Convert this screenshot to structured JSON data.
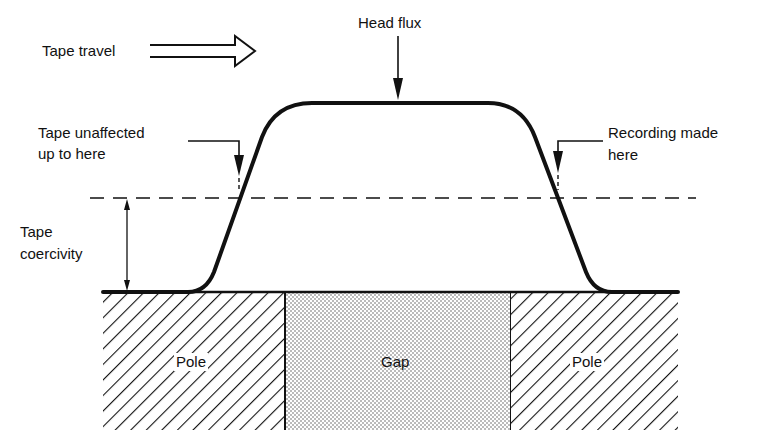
{
  "diagram": {
    "type": "magnetic-recording-head-field",
    "labels": {
      "tape_travel": "Tape travel",
      "head_flux": "Head flux",
      "tape_unaffected_line1": "Tape unaffected",
      "tape_unaffected_line2": "up to here",
      "recording_made_line1": "Recording made",
      "recording_made_line2": "here",
      "tape_coercivity_line1": "Tape",
      "tape_coercivity_line2": "coercivity",
      "pole_left": "Pole",
      "gap": "Gap",
      "pole_right": "Pole"
    },
    "colors": {
      "ink": "#111111",
      "background": "#ffffff",
      "gap_fill": "#d9d9d9"
    },
    "elements": [
      "tape travel direction arrow (hollow, pointing right)",
      "head flux curve (trapezoid with rounded corners)",
      "tape coercivity threshold (dashed horizontal line)",
      "coercivity dimension arrow",
      "left pole (hatched)",
      "gap (stippled)",
      "right pole (hatched)"
    ]
  }
}
